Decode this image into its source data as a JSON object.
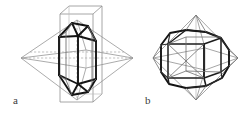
{
  "figure": {
    "kind": "crystallography-line-diagram",
    "background_color": "#ffffff",
    "bold_line_color": "#111111",
    "light_line_color": "#8c8c8c",
    "mid_line_color": "#5a5a5a",
    "panels": [
      {
        "id": "a",
        "label": "a",
        "label_x": 13,
        "label_y": 95,
        "caption": "a",
        "content": "Hexagonal dipyramidal crystal inscribed in a rectangular prism and an octahedron"
      },
      {
        "id": "b",
        "label": "b",
        "label_x": 145,
        "label_y": 95,
        "caption": "b",
        "content": "Truncated cube / cuboctahedral crystal inscribed in an octahedron"
      }
    ]
  }
}
